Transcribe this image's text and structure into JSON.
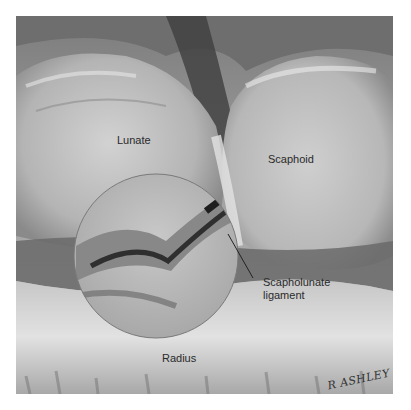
{
  "figure": {
    "labels": {
      "lunate": "Lunate",
      "scaphoid": "Scaphoid",
      "ligament_line1": "Scapholunate",
      "ligament_line2": "ligament",
      "radius": "Radius"
    },
    "signature": "R ASHLEY"
  },
  "colors": {
    "background": "#ffffff",
    "label_text": "#2a2a2a"
  }
}
